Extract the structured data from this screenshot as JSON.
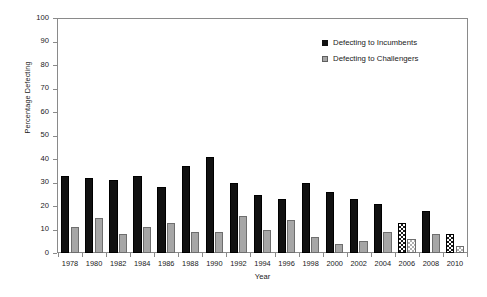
{
  "chart_data": {
    "type": "bar",
    "title": "",
    "xlabel": "Year",
    "ylabel": "Percentage Defecting",
    "ylim": [
      0,
      100
    ],
    "yticks": [
      0,
      10,
      20,
      30,
      40,
      50,
      60,
      70,
      80,
      90,
      100
    ],
    "grid": false,
    "legend_position": "top-right",
    "categories": [
      "1978",
      "1980",
      "1982",
      "1984",
      "1986",
      "1988",
      "1990",
      "1992",
      "1994",
      "1996",
      "1998",
      "2000",
      "2002",
      "2004",
      "2006",
      "2008",
      "2010"
    ],
    "series": [
      {
        "name": "Defecting to Incumbents",
        "color": "#111111",
        "values": [
          33,
          32,
          31,
          33,
          28,
          37,
          41,
          30,
          25,
          23,
          30,
          26,
          23,
          21,
          13,
          18,
          8
        ],
        "patterned_points": [
          "2006",
          "2010"
        ]
      },
      {
        "name": "Defecting to Challengers",
        "color": "#a6a6a6",
        "values": [
          11,
          15,
          8,
          11,
          13,
          9,
          9,
          16,
          10,
          14,
          7,
          4,
          5,
          9,
          6,
          8,
          3
        ],
        "patterned_points": [
          "2006",
          "2010"
        ]
      }
    ]
  },
  "legend": {
    "items": [
      {
        "label": "Defecting to Incumbents",
        "swatch": "incumbent"
      },
      {
        "label": "Defecting to Challengers",
        "swatch": "challenger"
      }
    ]
  },
  "axes": {
    "x_title": "Year",
    "y_title": "Percentage Defecting"
  }
}
